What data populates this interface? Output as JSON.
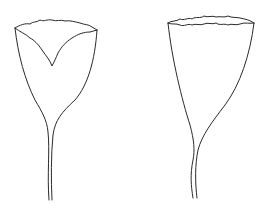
{
  "figure": {
    "background": "#ffffff",
    "stroke_color": "#2a2a2a",
    "items": [
      {
        "name": "left-specimen",
        "shape": "goblet with V-notched inner rim and thin stalk"
      },
      {
        "name": "right-specimen",
        "shape": "funnel with wavy rim and curved thin stalk"
      }
    ]
  }
}
